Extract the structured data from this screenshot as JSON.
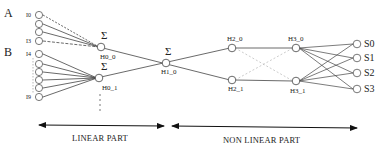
{
  "diagram": {
    "groups": [
      {
        "label": "A",
        "first_input": "I0",
        "last_input": "I3"
      },
      {
        "label": "B",
        "first_input": "I4",
        "last_input": "I9"
      }
    ],
    "sum_symbol": "Σ",
    "hidden_nodes": {
      "h0_0": "H0_0",
      "h0_1": "H0_1",
      "h1_0": "H1_0",
      "h2_0": "H2_0",
      "h2_1": "H2_1",
      "h3_0": "H3_0",
      "h3_1": "H3_1"
    },
    "outputs": [
      "S0",
      "S1",
      "S2",
      "S3"
    ],
    "sections": {
      "linear": "LINEAR PART",
      "nonlinear": "NON LINEAR PART"
    }
  }
}
